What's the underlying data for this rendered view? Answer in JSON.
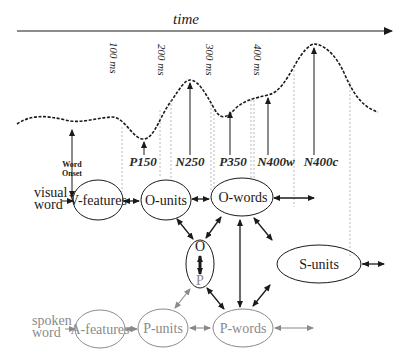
{
  "title": "time",
  "time_ticks": [
    "100 ms",
    "200 ms",
    "300 ms",
    "400 ms"
  ],
  "components": [
    "P150",
    "N250",
    "P350",
    "N400w",
    "N400c"
  ],
  "word_onset": "Word Onset",
  "word_onset_lines": [
    "Word",
    "Onset"
  ],
  "visual_input": {
    "line1": "visual",
    "line2": "word"
  },
  "spoken_input": {
    "line1": "spoken",
    "line2": "word"
  },
  "nodes": {
    "v_features": "V-features",
    "o_units": "O-units",
    "o_words": "O-words",
    "op_top": "O",
    "op_bottom": "P",
    "s_units": "S-units",
    "a_features": "A-features",
    "p_units": "P-units",
    "p_words": "P-words"
  },
  "colors": {
    "visual_stroke": "#1a1a1a",
    "spoken_stroke": "#8a8a8a",
    "guide_line": "#b0b0b0"
  }
}
